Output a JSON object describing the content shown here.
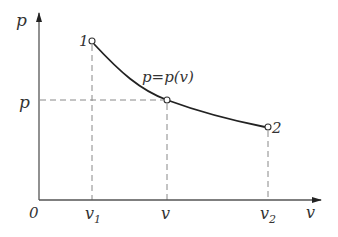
{
  "diagram": {
    "type": "p-v state curve",
    "axes": {
      "origin_label": "0",
      "x_axis_label": "v",
      "y_axis_label": "p"
    },
    "curve_label": "p=p(v)",
    "points": [
      {
        "id": "1",
        "label": "1",
        "x_label": "v",
        "x_sub": "1"
      },
      {
        "id": "mid",
        "label": "",
        "x_label": "v",
        "x_sub": "",
        "y_label": "p"
      },
      {
        "id": "2",
        "label": "2",
        "x_label": "v",
        "x_sub": "2"
      }
    ],
    "colors": {
      "curve": "#222222",
      "axes": "#555555",
      "dashed": "#888888",
      "text": "#333333"
    }
  }
}
